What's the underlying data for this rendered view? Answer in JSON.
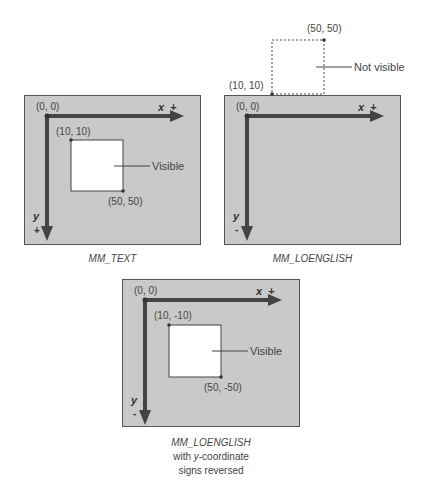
{
  "colors": {
    "panel": "#c9c9c9",
    "axis": "#444444",
    "rect": "#ffffff",
    "border": "#555555"
  },
  "diagrams": [
    {
      "caption": "MM_TEXT",
      "origin_label": "(0, 0)",
      "x_axis": "x",
      "x_sign": "+",
      "y_axis": "y",
      "y_sign": "+",
      "rect_top_left": "(10, 10)",
      "rect_bottom_right": "(50, 50)",
      "callout": "Visible"
    },
    {
      "caption": "MM_LOENGLISH",
      "origin_label": "(0, 0)",
      "x_axis": "x",
      "x_sign": "+",
      "y_axis": "y",
      "y_sign": "-",
      "rect_top_left": "(10, 10)",
      "rect_bottom_right": "(50, 50)",
      "callout": "Not visible"
    },
    {
      "caption": "MM_LOENGLISH",
      "caption_line2_pre": "with ",
      "caption_line2_em": "y",
      "caption_line2_post": "-coordinate",
      "caption_line3": "signs reversed",
      "origin_label": "(0, 0)",
      "x_axis": "x",
      "x_sign": "+",
      "y_axis": "y",
      "y_sign": "-",
      "rect_top_left": "(10, -10)",
      "rect_bottom_right": "(50, -50)",
      "callout": "Visible"
    }
  ]
}
